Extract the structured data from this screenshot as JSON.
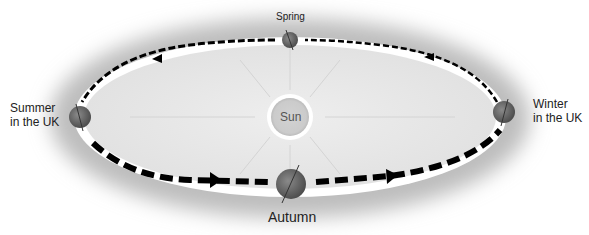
{
  "diagram": {
    "sun": {
      "label": "Sun"
    },
    "positions": [
      {
        "id": "spring",
        "label": "Spring"
      },
      {
        "id": "summer",
        "label_line1": "Summer",
        "label_line2": "in the UK"
      },
      {
        "id": "autumn",
        "label": "Autumn"
      },
      {
        "id": "winter",
        "label_line1": "Winter",
        "label_line2": "in the UK"
      }
    ],
    "orbit_direction": "counter-clockwise (top path right-to-left, bottom path left-to-right)",
    "colors": {
      "glow": "#d0d0d0",
      "orbit_fill": "#e9e9e9",
      "orbit_track": "#ffffff",
      "arrows": "#000000",
      "earth": "#6b6b6b",
      "sun": "#cfcfcf"
    }
  }
}
